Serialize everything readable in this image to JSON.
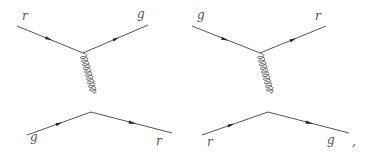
{
  "diagrams": [
    {
      "name": "t-channel gluon exchange (r g -> g r)",
      "labels": {
        "in_top": "r",
        "out_top": "g",
        "in_bottom": "g",
        "out_bottom": "r"
      }
    },
    {
      "name": "t-channel gluon exchange (g r -> r g)",
      "labels": {
        "in_top": "g",
        "out_top": "r",
        "in_bottom": "r",
        "out_bottom": "g"
      }
    }
  ],
  "trailing_punctuation": ","
}
